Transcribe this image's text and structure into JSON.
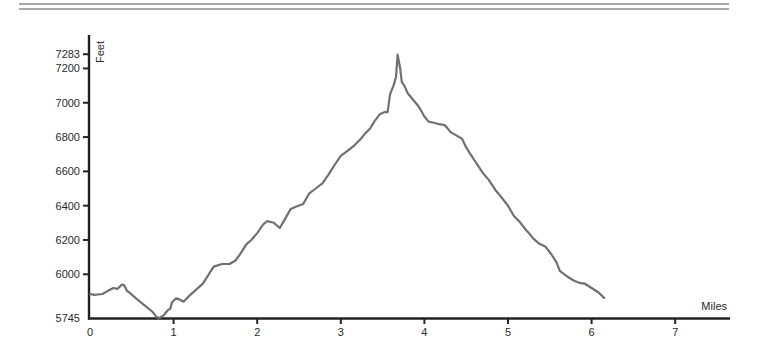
{
  "header": {
    "rules": 2
  },
  "chart_data": {
    "type": "line",
    "title": "",
    "xlabel": "Miles",
    "ylabel": "Feet",
    "xlim": [
      0,
      7.6
    ],
    "ylim": [
      5745,
      7283
    ],
    "x_ticks": [
      0,
      1,
      2,
      3,
      4,
      5,
      6,
      7
    ],
    "x_tick_labels": [
      "0",
      "1",
      "2",
      "3",
      "4",
      "5",
      "6",
      "7"
    ],
    "y_ticks": [
      5745,
      6000,
      6200,
      6400,
      6600,
      6800,
      7000,
      7200,
      7283
    ],
    "y_tick_labels": [
      "5745",
      "6000",
      "6200",
      "6400",
      "6600",
      "6800",
      "7000",
      "7200",
      "7283"
    ],
    "grid": false,
    "legend": null,
    "line_color": "#707070",
    "axis_color": "#222222",
    "series": [
      {
        "name": "Elevation profile",
        "x": [
          0.0,
          0.05,
          0.15,
          0.22,
          0.28,
          0.33,
          0.38,
          0.41,
          0.44,
          0.48,
          0.55,
          0.65,
          0.75,
          0.79,
          0.82,
          0.84,
          0.88,
          0.93,
          0.96,
          0.98,
          1.03,
          1.06,
          1.12,
          1.2,
          1.35,
          1.48,
          1.58,
          1.67,
          1.74,
          1.8,
          1.87,
          1.93,
          2.0,
          2.07,
          2.12,
          2.2,
          2.27,
          2.33,
          2.4,
          2.47,
          2.55,
          2.62,
          2.7,
          2.78,
          2.85,
          2.93,
          3.0,
          3.08,
          3.16,
          3.24,
          3.29,
          3.35,
          3.4,
          3.47,
          3.52,
          3.56,
          3.59,
          3.63,
          3.66,
          3.68,
          3.71,
          3.73,
          3.76,
          3.8,
          3.86,
          3.93,
          4.0,
          4.05,
          4.1,
          4.18,
          4.24,
          4.27,
          4.31,
          4.38,
          4.45,
          4.5,
          4.55,
          4.62,
          4.7,
          4.77,
          4.85,
          4.92,
          5.0,
          5.07,
          5.15,
          5.22,
          5.25,
          5.3,
          5.37,
          5.45,
          5.52,
          5.58,
          5.62,
          5.7,
          5.78,
          5.85,
          5.92,
          6.0,
          6.08,
          6.15
        ],
        "y": [
          5885,
          5880,
          5885,
          5905,
          5920,
          5915,
          5940,
          5935,
          5905,
          5890,
          5860,
          5820,
          5780,
          5755,
          5745,
          5748,
          5760,
          5790,
          5800,
          5835,
          5860,
          5855,
          5840,
          5880,
          5945,
          6045,
          6060,
          6060,
          6080,
          6120,
          6175,
          6200,
          6240,
          6290,
          6310,
          6300,
          6270,
          6320,
          6380,
          6395,
          6410,
          6470,
          6500,
          6530,
          6580,
          6640,
          6690,
          6720,
          6750,
          6790,
          6820,
          6850,
          6890,
          6935,
          6945,
          6945,
          7050,
          7100,
          7150,
          7280,
          7200,
          7120,
          7100,
          7055,
          7020,
          6980,
          6920,
          6890,
          6885,
          6875,
          6870,
          6855,
          6830,
          6810,
          6790,
          6740,
          6700,
          6650,
          6590,
          6550,
          6490,
          6450,
          6400,
          6340,
          6300,
          6255,
          6240,
          6210,
          6180,
          6160,
          6115,
          6070,
          6020,
          5990,
          5965,
          5950,
          5945,
          5920,
          5895,
          5862
        ]
      }
    ]
  }
}
